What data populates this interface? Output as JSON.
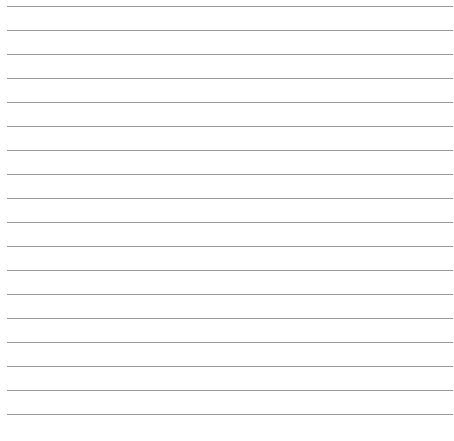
{
  "page": {
    "type": "lined-paper",
    "line_count": 18,
    "line_start_y": 6,
    "line_spacing": 24,
    "line_color": "#9a9a9a",
    "background_color": "#ffffff"
  }
}
